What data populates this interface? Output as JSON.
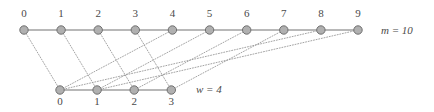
{
  "figure": {
    "type": "bipartite-mapping-diagram",
    "background_color": "#ffffff",
    "node_fill_color": "#b0b0b0",
    "node_stroke_color": "#707070",
    "row_edge_color": "#a0a0a0",
    "mapping_edge_color": "#9a9a9a",
    "label_color": "#4a4a4a"
  },
  "top_row": {
    "name": "m",
    "count": 10,
    "side_label": "m = 10",
    "side_label_x": 381,
    "side_label_y": 25,
    "y": 30,
    "start_x": 24,
    "spacing": 37.1,
    "labels": [
      "0",
      "1",
      "2",
      "3",
      "4",
      "5",
      "6",
      "7",
      "8",
      "9"
    ],
    "label_y": 8,
    "nodes": [
      {
        "label": "0",
        "x": 24,
        "y": 30
      },
      {
        "label": "1",
        "x": 61.1,
        "y": 30
      },
      {
        "label": "2",
        "x": 98.2,
        "y": 30
      },
      {
        "label": "3",
        "x": 135.3,
        "y": 30
      },
      {
        "label": "4",
        "x": 172.4,
        "y": 30
      },
      {
        "label": "5",
        "x": 209.6,
        "y": 30
      },
      {
        "label": "6",
        "x": 246.7,
        "y": 30
      },
      {
        "label": "7",
        "x": 283.8,
        "y": 30
      },
      {
        "label": "8",
        "x": 320.9,
        "y": 30
      },
      {
        "label": "9",
        "x": 358,
        "y": 30
      }
    ]
  },
  "bottom_row": {
    "name": "w",
    "count": 4,
    "side_label": "w = 4",
    "side_label_x": 196,
    "side_label_y": 84,
    "y": 90,
    "start_x": 60,
    "spacing": 37.1,
    "labels": [
      "0",
      "1",
      "2",
      "3"
    ],
    "label_y": 96,
    "nodes": [
      {
        "label": "0",
        "x": 60,
        "y": 90
      },
      {
        "label": "1",
        "x": 97.1,
        "y": 90
      },
      {
        "label": "2",
        "x": 134.2,
        "y": 90
      },
      {
        "label": "3",
        "x": 171.3,
        "y": 90
      }
    ]
  },
  "mapping_edges": [
    {
      "from_top": 0,
      "to_bottom": 0
    },
    {
      "from_top": 1,
      "to_bottom": 1
    },
    {
      "from_top": 2,
      "to_bottom": 2
    },
    {
      "from_top": 3,
      "to_bottom": 3
    },
    {
      "from_top": 4,
      "to_bottom": 0
    },
    {
      "from_top": 5,
      "to_bottom": 1
    },
    {
      "from_top": 6,
      "to_bottom": 2
    },
    {
      "from_top": 7,
      "to_bottom": 3
    },
    {
      "from_top": 8,
      "to_bottom": 0
    },
    {
      "from_top": 9,
      "to_bottom": 1
    }
  ],
  "node_radius": 4.2
}
